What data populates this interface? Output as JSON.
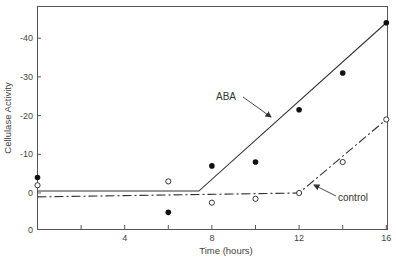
{
  "chart_data": {
    "type": "scatter",
    "title": "",
    "xlabel": "Time (hours)",
    "ylabel": "Cellulase Activity",
    "xlim": [
      0,
      16
    ],
    "ylim": [
      9.3,
      -47
    ],
    "x_ticks": [
      {
        "value": 2,
        "label": ""
      },
      {
        "value": 4,
        "label": "4"
      },
      {
        "value": 6,
        "label": ""
      },
      {
        "value": 8,
        "label": "8"
      },
      {
        "value": 10,
        "label": ""
      },
      {
        "value": 12,
        "label": "12"
      },
      {
        "value": 14,
        "label": ""
      },
      {
        "value": 16,
        "label": "16"
      }
    ],
    "y_ticks": [
      {
        "value": -40,
        "label": "-40"
      },
      {
        "value": -30,
        "label": "-30"
      },
      {
        "value": -20,
        "label": "-20"
      },
      {
        "value": -10,
        "label": "-10"
      },
      {
        "value": 0,
        "label": "0"
      },
      {
        "value": 9.3,
        "label": "0"
      }
    ],
    "grid": false,
    "series": [
      {
        "name": "ABA",
        "marker": "filled-circle",
        "points": [
          {
            "x": 0,
            "y": -4
          },
          {
            "x": 6,
            "y": 5
          },
          {
            "x": 8,
            "y": -7
          },
          {
            "x": 10,
            "y": -8
          },
          {
            "x": 12,
            "y": -21.5
          },
          {
            "x": 14,
            "y": -31
          },
          {
            "x": 16,
            "y": -44
          }
        ],
        "fit_line": {
          "style": "solid",
          "points": [
            [
              0,
              -0.5
            ],
            [
              7.4,
              -0.5
            ],
            [
              16,
              -44
            ]
          ]
        }
      },
      {
        "name": "control",
        "marker": "open-circle",
        "points": [
          {
            "x": 0,
            "y": -2
          },
          {
            "x": 6,
            "y": -3
          },
          {
            "x": 8,
            "y": 2.5
          },
          {
            "x": 10,
            "y": 1.5
          },
          {
            "x": 12,
            "y": 0
          },
          {
            "x": 14,
            "y": -8
          },
          {
            "x": 16,
            "y": -19
          }
        ],
        "fit_line": {
          "style": "dash-dot",
          "points": [
            [
              0,
              1
            ],
            [
              12,
              0
            ],
            [
              16,
              -19
            ]
          ]
        }
      }
    ],
    "annotations": [
      {
        "text": "ABA",
        "arrow_to": {
          "x": 8.1,
          "y": -8
        }
      },
      {
        "text": "control",
        "arrow_to": {
          "x": 12.5,
          "y": -1.5
        }
      }
    ],
    "legend": null
  },
  "labels": {
    "xlabel": "Time (hours)",
    "ylabel": "Cellulase Activity",
    "aba": "ABA",
    "control": "control",
    "footnote": "..."
  }
}
